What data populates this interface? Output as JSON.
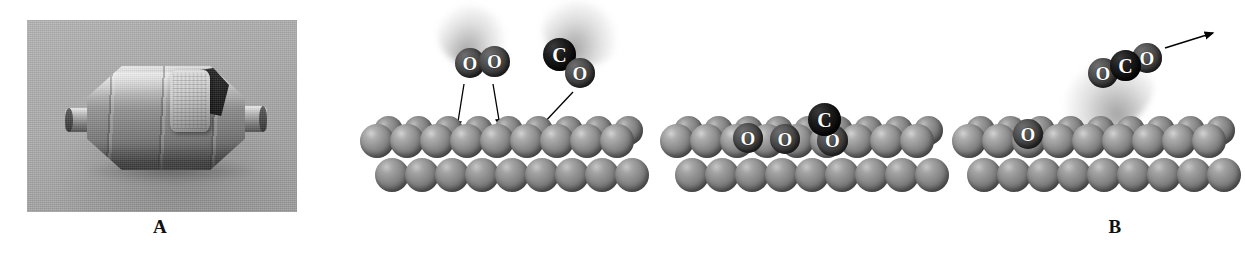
{
  "figure": {
    "panels": [
      {
        "id": "A",
        "label": "A",
        "caption_letter": "A",
        "content": "photograph-of-catalytic-converter",
        "photo_background_color": "#a8a8a8",
        "objects": [
          "catalytic-converter-canister",
          "cutaway-honeycomb-monolith",
          "inlet-pipe",
          "outlet-pipe"
        ]
      },
      {
        "id": "B",
        "label": "B",
        "caption_letter": "B",
        "content": "heterogeneous-catalysis-mechanism-diagram",
        "steps": [
          {
            "index": 1,
            "name": "adsorption",
            "description": "O2 and CO molecules approach and adsorb onto the metal catalyst surface",
            "molecules": [
              {
                "formula": "O2",
                "atoms": [
                  {
                    "symbol": "O",
                    "color": "#4a4a4a"
                  },
                  {
                    "symbol": "O",
                    "color": "#4a4a4a"
                  }
                ],
                "state": "gas",
                "moving": true
              },
              {
                "formula": "CO",
                "atoms": [
                  {
                    "symbol": "C",
                    "color": "#0d0d0d"
                  },
                  {
                    "symbol": "O",
                    "color": "#4a4a4a"
                  }
                ],
                "state": "gas",
                "moving": true
              }
            ],
            "arrow_count": 3,
            "arrow_direction": "down-toward-surface"
          },
          {
            "index": 2,
            "name": "dissociation-and-surface-diffusion",
            "description": "O2 dissociates into two O atoms; CO remains intact; all are bound to the surface",
            "surface_species": [
              {
                "symbol": "O",
                "color": "#4a4a4a"
              },
              {
                "symbol": "O",
                "color": "#4a4a4a"
              },
              {
                "formula": "CO",
                "atoms": [
                  {
                    "symbol": "C",
                    "color": "#0d0d0d"
                  },
                  {
                    "symbol": "O",
                    "color": "#4a4a4a"
                  }
                ]
              }
            ],
            "arrow_count": 0
          },
          {
            "index": 3,
            "name": "reaction-and-desorption",
            "description": "Adsorbed CO combines with an O atom to form CO2, which desorbs from the surface; one O atom remains",
            "molecules": [
              {
                "formula": "CO2",
                "atoms": [
                  {
                    "symbol": "O",
                    "color": "#4a4a4a"
                  },
                  {
                    "symbol": "C",
                    "color": "#0d0d0d"
                  },
                  {
                    "symbol": "O",
                    "color": "#4a4a4a"
                  }
                ],
                "state": "gas",
                "moving": true
              }
            ],
            "surface_species": [
              {
                "symbol": "O",
                "color": "#4a4a4a"
              }
            ],
            "arrow_count": 1,
            "arrow_direction": "up-and-away-from-surface"
          }
        ],
        "catalyst_surface": {
          "name": "metal-catalyst-surface",
          "appearance": "close-packed-spheres",
          "sphere_color": "#8e8e8e",
          "rows": 3
        }
      }
    ]
  },
  "atom_labels": {
    "oxygen": "O",
    "carbon": "C"
  },
  "colors": {
    "page_background": "#ffffff",
    "oxygen_atom": "#4a4a4a",
    "carbon_atom": "#0d0d0d",
    "metal_sphere": "#8e8e8e",
    "arrow": "#000000",
    "label_text": "#111111"
  }
}
